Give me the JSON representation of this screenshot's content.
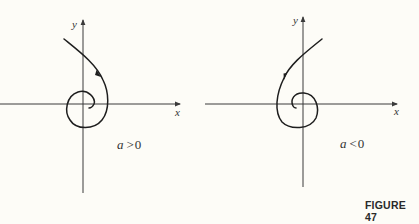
{
  "figure": {
    "caption": "FIGURE 47",
    "background": "#fdfcf7",
    "ink_color": "#1e1e1e"
  },
  "panels": [
    {
      "id": "left",
      "x_label": "x",
      "y_label": "y",
      "condition_var": "a",
      "condition_op": ">",
      "condition_val": "0",
      "description": "Spiral trajectory winding inward toward origin, arrow pointing upward along outer arm (counterclockwise outward flow)"
    },
    {
      "id": "right",
      "x_label": "x",
      "y_label": "y",
      "condition_var": "a",
      "condition_op": "<",
      "condition_val": "0",
      "description": "Spiral trajectory mirror image, arrow pointing downward along outer arm (spiraling inward)"
    }
  ]
}
